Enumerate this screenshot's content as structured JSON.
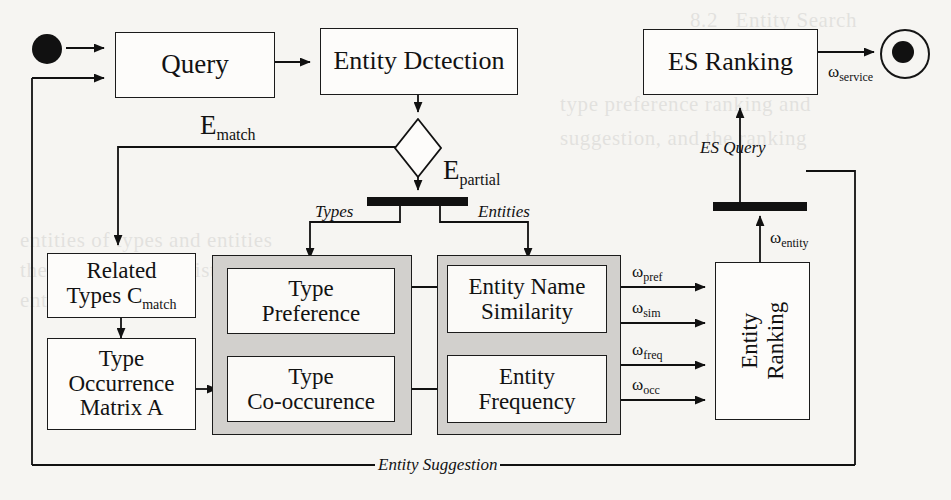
{
  "diagram": {
    "nodes": {
      "query": "Query",
      "entity_detection": "Entity Dctection",
      "es_ranking": "ES Ranking",
      "related_types": "Related\nTypes C",
      "related_types_line1": "Related",
      "related_types_line2": "Types C",
      "related_types_sub": "match",
      "type_occurrence_l1": "Type",
      "type_occurrence_l2": "Occurrence",
      "type_occurrence_l3": "Matrix A",
      "type_preference_l1": "Type",
      "type_preference_l2": "Preference",
      "type_cooccurence_l1": "Type",
      "type_cooccurence_l2": "Co-occurence",
      "entity_name_similarity_l1": "Entity Name",
      "entity_name_similarity_l2": "Similarity",
      "entity_frequency_l1": "Entity",
      "entity_frequency_l2": "Frequency",
      "entity_ranking_l1": "Entity",
      "entity_ranking_l2": "Ranking"
    },
    "flow_labels": {
      "e_match": "E",
      "e_match_sub": "match",
      "e_partial": "E",
      "e_partial_sub": "partial",
      "types": "Types",
      "entities": "Entities",
      "es_query": "ES Query",
      "entity_suggestion": "Entity Suggestion"
    },
    "weights": {
      "service": "ω",
      "service_sub": "service",
      "entity": "ω",
      "entity_sub": "entity",
      "pref": "ω",
      "pref_sub": "pref",
      "sim": "ω",
      "sim_sub": "sim",
      "freq": "ω",
      "freq_sub": "freq",
      "occ": "ω",
      "occ_sub": "occ"
    },
    "colors": {
      "ink": "#111111",
      "page": "#f6f5f2",
      "panel_fill": "#d2d0cd",
      "node_fill": "#fdfcfa"
    },
    "background_text": {
      "l1": "8.2   Entity Search",
      "l2": "are",
      "l3": "type preference ranking and",
      "l4": "suggestion, and the ranking",
      "l5": "",
      "l6": "entities of types and entities",
      "l7": "the similar ranked list of",
      "l8": "entities as follows."
    }
  }
}
